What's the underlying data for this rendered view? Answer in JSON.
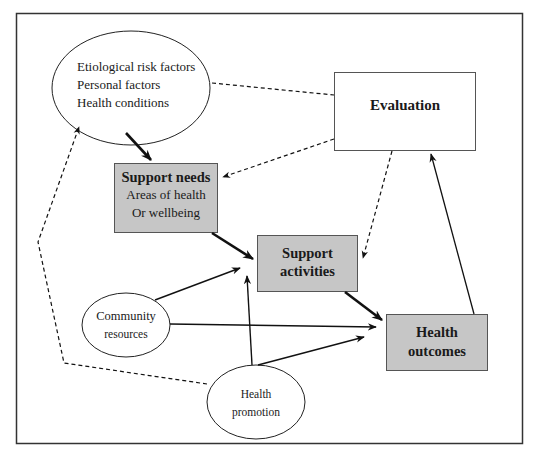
{
  "diagram": {
    "colors": {
      "frame": "#333333",
      "box_fill": "#c6c6c6",
      "box_border": "#555555",
      "line": "#111111",
      "background": "#ffffff"
    },
    "nodes": {
      "etiological": {
        "shape": "ellipse",
        "lines": [
          "Etiological risk factors",
          "Personal factors",
          "Health conditions"
        ]
      },
      "evaluation": {
        "shape": "rectangle",
        "title": "Evaluation"
      },
      "support_needs": {
        "shape": "rectangle-filled",
        "title": "Support needs",
        "lines": [
          "Areas of health",
          "Or wellbeing"
        ]
      },
      "support_activities": {
        "shape": "rectangle-filled",
        "title_lines": [
          "Support",
          "activities"
        ]
      },
      "health_outcomes": {
        "shape": "rectangle-filled",
        "title_lines": [
          "Health",
          "outcomes"
        ]
      },
      "community_resources": {
        "shape": "ellipse",
        "lines": [
          "Community",
          "resources"
        ]
      },
      "health_promotion": {
        "shape": "ellipse",
        "lines": [
          "Health",
          "promotion"
        ]
      }
    },
    "edges": [
      {
        "from": "etiological",
        "to": "support_needs",
        "style": "solid-thick"
      },
      {
        "from": "etiological",
        "to": "evaluation",
        "style": "dashed",
        "arrow": false
      },
      {
        "from": "evaluation",
        "to": "support_needs",
        "style": "dashed"
      },
      {
        "from": "evaluation",
        "to": "support_activities",
        "style": "dashed"
      },
      {
        "from": "support_needs",
        "to": "support_activities",
        "style": "solid-thick"
      },
      {
        "from": "community_resources",
        "to": "support_activities",
        "style": "solid"
      },
      {
        "from": "community_resources",
        "to": "health_outcomes",
        "style": "solid"
      },
      {
        "from": "health_promotion",
        "to": "support_activities",
        "style": "solid"
      },
      {
        "from": "health_promotion",
        "to": "health_outcomes",
        "style": "solid"
      },
      {
        "from": "health_promotion",
        "to": "etiological",
        "style": "dashed"
      },
      {
        "from": "support_activities",
        "to": "health_outcomes",
        "style": "solid-thick"
      },
      {
        "from": "health_outcomes",
        "to": "evaluation",
        "style": "solid"
      }
    ]
  }
}
